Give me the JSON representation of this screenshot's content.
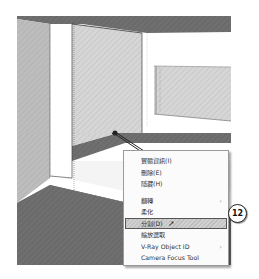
{
  "context_menu": {
    "items": [
      {
        "label": "實體資訊(I)",
        "submenu": false
      },
      {
        "label": "刪除(E)",
        "submenu": false
      },
      {
        "label": "隱藏(H)",
        "submenu": false
      },
      {
        "separator": true
      },
      {
        "label": "翻轉",
        "submenu": true
      },
      {
        "label": "柔化",
        "submenu": false
      },
      {
        "label": "分割(D)",
        "submenu": false,
        "highlighted": true
      },
      {
        "label": "縮放選取",
        "submenu": false
      },
      {
        "label": "V-Ray Object ID",
        "submenu": true
      },
      {
        "label": "Camera Focus Tool",
        "submenu": false
      }
    ],
    "submenu_arrow": "›"
  },
  "callout": {
    "number": "12"
  },
  "colors": {
    "menu_border": "#9a9a9a",
    "highlight_border": "#555555",
    "wall_dark": "#6e6e6e",
    "wall_light": "#d4d4d4"
  }
}
